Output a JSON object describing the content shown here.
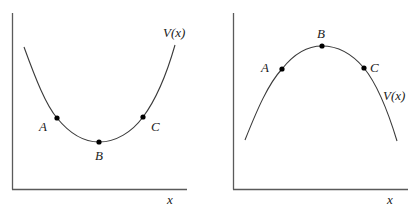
{
  "panels": [
    {
      "id": "left",
      "shape": "potential well (minimum)",
      "curve_label": "V(x)",
      "x_axis_label": "x",
      "points": [
        {
          "label": "A",
          "position": "left slope"
        },
        {
          "label": "B",
          "position": "minimum"
        },
        {
          "label": "C",
          "position": "right slope"
        }
      ]
    },
    {
      "id": "right",
      "shape": "potential hill (maximum)",
      "curve_label": "V(x)",
      "x_axis_label": "x",
      "points": [
        {
          "label": "A",
          "position": "left slope"
        },
        {
          "label": "B",
          "position": "maximum"
        },
        {
          "label": "C",
          "position": "right slope"
        }
      ]
    }
  ],
  "colors": {
    "axis": "#5a5a5a",
    "curve": "#3a3a3a",
    "point": "#000000",
    "text": "#222222"
  }
}
